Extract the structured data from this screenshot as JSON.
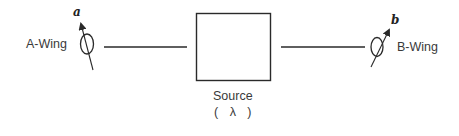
{
  "diagram": {
    "left_wing": {
      "label": "A-Wing",
      "setting_label": "a"
    },
    "right_wing": {
      "label": "B-Wing",
      "setting_label": "b"
    },
    "source": {
      "label": "Source",
      "parameter": "( λ )"
    },
    "colors": {
      "stroke": "#2a2a2a",
      "text": "#3a3a3a",
      "background": "#ffffff"
    }
  }
}
